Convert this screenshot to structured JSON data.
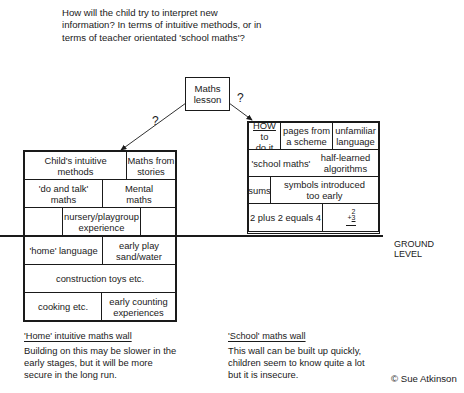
{
  "question": "How will the child try to interpret new information? In terms of intuitive methods, or in terms of teacher orientated 'school maths'?",
  "lesson_box": {
    "line1": "Maths",
    "line2": "lesson"
  },
  "arrows": {
    "left_label": "?",
    "right_label": "?"
  },
  "home_wall": {
    "above_ground": {
      "row1": [
        {
          "line1": "Child's intuitive",
          "line2": "methods"
        },
        {
          "line1": "Maths from",
          "line2": "stories"
        }
      ],
      "row2": [
        {
          "line1": "'do and talk'",
          "line2": "maths"
        },
        {
          "line1": "Mental",
          "line2": "maths"
        }
      ],
      "row3": [
        {
          "line1": ""
        },
        {
          "line1": "nursery/playgroup",
          "line2": "experience"
        },
        {
          "line1": ""
        }
      ]
    },
    "below_ground": {
      "row1": [
        {
          "line1": "'home' language"
        },
        {
          "line1": "early play",
          "line2": "sand/water"
        }
      ],
      "row2": [
        {
          "line1": "construction toys etc."
        }
      ],
      "row3": [
        {
          "line1": "cooking etc."
        },
        {
          "line1": "early counting",
          "line2": "experiences"
        }
      ]
    },
    "caption_title": "'Home' intuitive maths wall",
    "caption_line1": "Building on this may be slower in the",
    "caption_line2": "early stages, but it will be more",
    "caption_line3": "secure in the long run."
  },
  "school_wall": {
    "row1": [
      {
        "line1": "HOW",
        "line1b": " to",
        "line2": "do it"
      },
      {
        "line1": "pages from",
        "line2": "a scheme"
      },
      {
        "line1": "unfamiliar",
        "line2": "language"
      }
    ],
    "row2": [
      {
        "line1": "'school maths'"
      },
      {
        "line1": "half-learned",
        "line2": "algorithms"
      }
    ],
    "row3": [
      {
        "line1": "sums"
      },
      {
        "line1": "symbols introduced",
        "line2": "too early"
      }
    ],
    "row4": [
      {
        "line1": "2 plus 2 equals 4"
      },
      {
        "top": "2",
        "bottom": "3",
        "op": "+"
      }
    ],
    "caption_title": "'School' maths wall",
    "caption_line1": "This wall can be built up quickly,",
    "caption_line2": "children seem to know quite a lot",
    "caption_line3": "but it is insecure."
  },
  "ground_label": "GROUND LEVEL",
  "copyright": "© Sue Atkinson"
}
